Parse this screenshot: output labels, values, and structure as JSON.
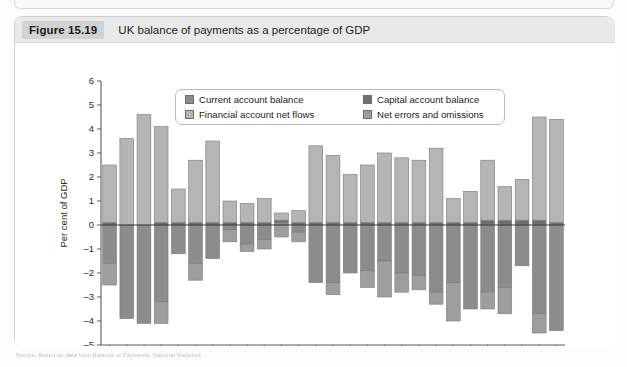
{
  "figure": {
    "tag": "Figure 15.19",
    "title": "UK balance of payments as a percentage of GDP",
    "footer_note": "Source: Based on data from Balance of Payments, National Statistics"
  },
  "legend": {
    "items": [
      {
        "label": "Current account balance",
        "color": "#8c8c8c",
        "key": "current_account_balance"
      },
      {
        "label": "Capital account balance",
        "color": "#6f6f6f",
        "key": "capital_account_balance"
      },
      {
        "label": "Financial account net flows",
        "color": "#b5b5b5",
        "key": "financial_account_net_flows"
      },
      {
        "label": "Net errors and omissions",
        "color": "#9e9e9e",
        "key": "net_errors_and_omissions"
      }
    ]
  },
  "chart_data": {
    "type": "bar",
    "subtype": "stacked-diverging",
    "title": "UK balance of payments as a percentage of GDP",
    "xlabel": "",
    "ylabel": "Per cent of GDP",
    "ylim": [
      -5,
      6
    ],
    "yticks": [
      6,
      5,
      4,
      3,
      2,
      1,
      0,
      -1,
      -2,
      -3,
      -4,
      -5
    ],
    "ytick_labels": [
      "6",
      "5",
      "4",
      "3",
      "2",
      "1",
      "0",
      "-1",
      "-2",
      "-3",
      "-4",
      "-5"
    ],
    "grid": false,
    "legend_position": "top-center",
    "x_tick_labels_shown": [
      "1987",
      "1992",
      "1997",
      "2002",
      "2007",
      "2012"
    ],
    "categories": [
      "1987",
      "1988",
      "1989",
      "1990",
      "1991",
      "1992",
      "1993",
      "1994",
      "1995",
      "1996",
      "1997",
      "1998",
      "1999",
      "2000",
      "2001",
      "2002",
      "2003",
      "2004",
      "2005",
      "2006",
      "2007",
      "2008",
      "2009",
      "2010",
      "2011",
      "2012",
      "2013"
    ],
    "series": [
      {
        "name": "Current account balance",
        "color": "#8c8c8c",
        "values": [
          -1.6,
          -3.9,
          -4.1,
          -3.2,
          -1.2,
          -1.6,
          -1.4,
          -0.2,
          -0.8,
          -0.6,
          0.1,
          -0.3,
          -2.4,
          -2.4,
          -2.0,
          -1.9,
          -1.5,
          -2.0,
          -2.1,
          -2.8,
          -2.4,
          -3.5,
          -2.8,
          -2.6,
          -1.7,
          -3.7,
          -4.4
        ]
      },
      {
        "name": "Capital account balance",
        "color": "#6f6f6f",
        "values": [
          0.1,
          0.0,
          0.0,
          0.1,
          0.1,
          0.1,
          0.1,
          0.1,
          0.1,
          0.1,
          0.1,
          0.1,
          0.1,
          0.1,
          0.1,
          0.1,
          0.1,
          0.1,
          0.1,
          0.1,
          0.1,
          0.1,
          0.2,
          0.2,
          0.2,
          0.2,
          0.1
        ]
      },
      {
        "name": "Financial account net flows",
        "color": "#b5b5b5",
        "values": [
          2.4,
          3.6,
          4.6,
          4.0,
          1.4,
          2.6,
          3.4,
          0.9,
          0.8,
          1.0,
          0.3,
          0.5,
          3.2,
          2.8,
          2.0,
          2.4,
          2.9,
          2.7,
          2.6,
          3.1,
          1.0,
          1.3,
          2.5,
          1.4,
          1.7,
          4.3,
          4.3
        ]
      },
      {
        "name": "Net errors and omissions",
        "color": "#9e9e9e",
        "values": [
          -0.9,
          0.0,
          0.0,
          -0.9,
          0.0,
          -0.7,
          0.0,
          -0.5,
          -0.3,
          -0.4,
          -0.5,
          -0.4,
          0.0,
          -0.5,
          0.0,
          -0.7,
          -1.5,
          -0.8,
          -0.6,
          -0.5,
          -1.6,
          0.0,
          -0.7,
          -1.1,
          0.0,
          -0.8,
          0.0
        ]
      }
    ]
  }
}
